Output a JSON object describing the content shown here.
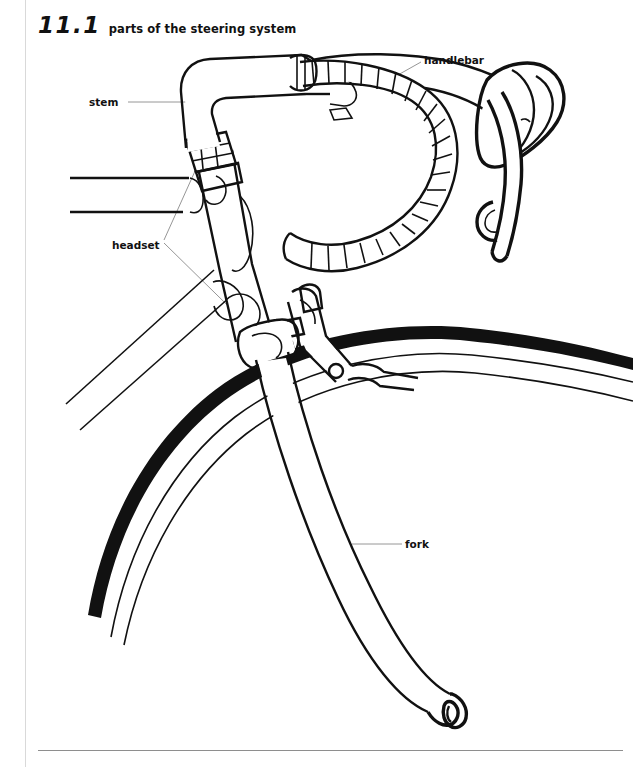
{
  "page": {
    "heading_number": "11.1",
    "heading_title": "parts of the steering system"
  },
  "labels": {
    "stem": "stem",
    "handlebar": "handlebar",
    "headset": "headset",
    "fork": "fork"
  },
  "colors": {
    "ink": "#111111",
    "paper": "#ffffff",
    "leader_line": "#8a8a8a",
    "margin_rule": "#d9d9d9",
    "footer_rule": "#8e8e8e"
  },
  "diagram": {
    "view": "side-profile-line-drawing",
    "parts": [
      "handlebar",
      "handlebar-tape",
      "brake-lever",
      "stem",
      "headset",
      "head-tube",
      "top-tube",
      "down-tube",
      "fork",
      "fork-dropout",
      "brake-caliper",
      "tire",
      "rim"
    ]
  }
}
